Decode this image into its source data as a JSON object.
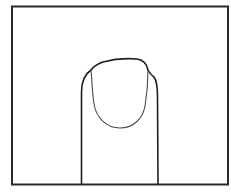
{
  "figure": {
    "colors": {
      "background": "#ffffff",
      "frame_stroke": "#2a2a2a",
      "finger_stroke": "#1e1e1e",
      "nail_stroke": "#4a4a4a"
    }
  }
}
